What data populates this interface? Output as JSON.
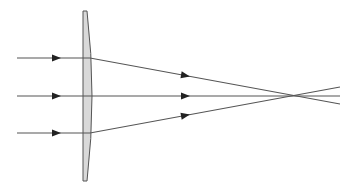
{
  "diagram": {
    "colors": {
      "ray": "#555555",
      "arrow": "#222222",
      "lens_fill": "#d9d9d9",
      "lens_stroke": "#555555",
      "background": "#ffffff"
    },
    "lens": {
      "flat_x": 83,
      "top_y": 11,
      "bottom_y": 181,
      "bulge_x": 92,
      "top_right_x": 87,
      "bottom_right_x": 87
    },
    "focal_point": {
      "x": 295,
      "y": 96
    },
    "rays": [
      {
        "name": "upper",
        "start": [
          17,
          58
        ],
        "at_lens": [
          90,
          58
        ],
        "end": [
          340,
          104
        ],
        "arrow_in": [
          57,
          58
        ],
        "arrow_out": [
          186,
          76
        ]
      },
      {
        "name": "middle",
        "start": [
          17,
          96
        ],
        "at_lens": [
          92,
          96
        ],
        "end": [
          340,
          96
        ],
        "arrow_in": [
          57,
          96
        ],
        "arrow_out": [
          186,
          96
        ]
      },
      {
        "name": "lower",
        "start": [
          17,
          133
        ],
        "at_lens": [
          90,
          133
        ],
        "end": [
          340,
          87
        ],
        "arrow_in": [
          57,
          133
        ],
        "arrow_out": [
          186,
          115
        ]
      }
    ]
  }
}
